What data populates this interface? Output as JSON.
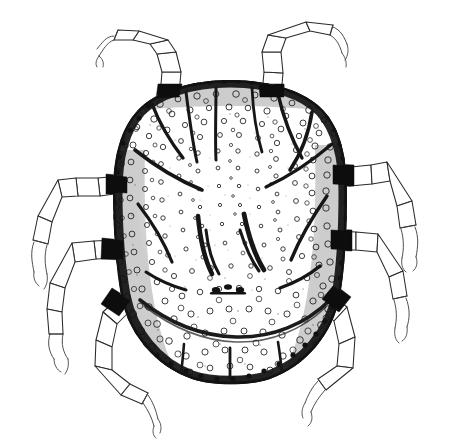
{
  "figure": {
    "domain": "Natural-Image",
    "kind": "scientific-line-illustration",
    "subject_name": "mite-dorsal-view",
    "view": "dorsal",
    "technique": "pen-and-ink stipple drawing",
    "caption": "",
    "title": "",
    "labels": [],
    "text_present": false,
    "canvas": {
      "width": 451,
      "height": 444
    },
    "colors": {
      "background": "#ffffff",
      "ink": "#1a1a1a",
      "ink_dark": "#0d0d0d",
      "ink_mid": "#2a2a2a",
      "ink_light": "#3a3a3a",
      "stipple": "#1d1d1d"
    },
    "body": {
      "name": "idiosoma",
      "outline_note": "broadly oval, almost rectangular-rounded, widest at mid-length",
      "bounds": {
        "x": 112,
        "y": 80,
        "width": 236,
        "height": 307
      },
      "center": {
        "cx": 230,
        "cy": 233
      },
      "margin_style": "dark crenulate beaded border",
      "texture": "dense punctate stipple with small open circular pores",
      "pore_count": 520
    },
    "features": [
      {
        "name": "dorsal-striae-anterior",
        "count": 6,
        "note": "dark radiating striae fanning from anterior margin inward"
      },
      {
        "name": "dorsal-striae-lateral",
        "count": 4,
        "note": "oblique dark striae on lateral shoulders"
      },
      {
        "name": "central-chevron",
        "count": 2,
        "note": "paired V-shaped dark striae flanking midline"
      },
      {
        "name": "median-genital-mark",
        "count": 1,
        "note": "small dark transverse cluster at mid-posterior"
      },
      {
        "name": "transverse-groove",
        "count": 1,
        "note": "broad arcuate sejugal groove across posterior third"
      },
      {
        "name": "posterior-striae",
        "count": 3,
        "note": "short vertical striae near posterior margin"
      }
    ],
    "legs": {
      "count": 8,
      "segments_per_leg": 5,
      "segment_names": [
        "coxa",
        "trochanter",
        "femur",
        "genu",
        "tibia",
        "tarsus"
      ],
      "tip": "paired claws",
      "items": [
        {
          "id": "leg-1-left",
          "position": "anterior-left",
          "attach": {
            "x": 165,
            "y": 92
          },
          "direction": "up-left"
        },
        {
          "id": "leg-1-right",
          "position": "anterior-right",
          "attach": {
            "x": 268,
            "y": 90
          },
          "direction": "up-right"
        },
        {
          "id": "leg-2-left",
          "position": "antero-lateral-left",
          "attach": {
            "x": 117,
            "y": 183
          },
          "direction": "left-up"
        },
        {
          "id": "leg-2-right",
          "position": "antero-lateral-right",
          "attach": {
            "x": 330,
            "y": 173
          },
          "direction": "right-up"
        },
        {
          "id": "leg-3-left",
          "position": "postero-lateral-left",
          "attach": {
            "x": 110,
            "y": 247
          },
          "direction": "left"
        },
        {
          "id": "leg-3-right",
          "position": "postero-lateral-right",
          "attach": {
            "x": 337,
            "y": 240
          },
          "direction": "right"
        },
        {
          "id": "leg-4-left",
          "position": "posterior-left",
          "attach": {
            "x": 127,
            "y": 303
          },
          "direction": "down-left"
        },
        {
          "id": "leg-4-right",
          "position": "posterior-right",
          "attach": {
            "x": 330,
            "y": 300
          },
          "direction": "down-right"
        }
      ]
    }
  }
}
